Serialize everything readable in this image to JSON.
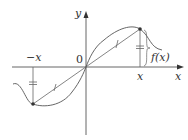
{
  "diagram": {
    "axes": {
      "x_label": "x",
      "y_label": "y",
      "origin_label": "0"
    },
    "labels": {
      "pos_x": "x",
      "neg_x": "−x",
      "fx": "f(x)"
    },
    "colors": {
      "line": "#555555",
      "point": "#333333",
      "background": "#ffffff"
    }
  }
}
